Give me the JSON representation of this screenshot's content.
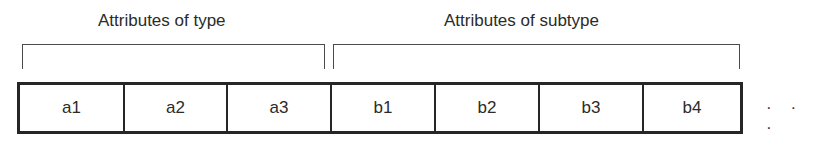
{
  "diagram": {
    "groups": [
      {
        "label": "Attributes of type",
        "covers": [
          "a1",
          "a2",
          "a3"
        ]
      },
      {
        "label": "Attributes of subtype",
        "covers": [
          "b1",
          "b2",
          "b3",
          "b4"
        ]
      }
    ],
    "cells": [
      {
        "label": "a1",
        "group": "type"
      },
      {
        "label": "a2",
        "group": "type"
      },
      {
        "label": "a3",
        "group": "type"
      },
      {
        "label": "b1",
        "group": "subtype"
      },
      {
        "label": "b2",
        "group": "subtype"
      },
      {
        "label": "b3",
        "group": "subtype"
      },
      {
        "label": "b4",
        "group": "subtype"
      }
    ],
    "continuation": "· · ·"
  }
}
